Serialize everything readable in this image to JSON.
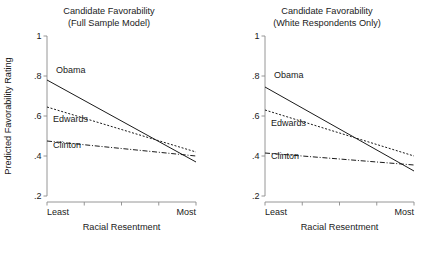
{
  "figure": {
    "width": 436,
    "height": 253,
    "background": "#ffffff",
    "ink_color": "#1a1a1a",
    "axis_color": "#8a8a8a"
  },
  "chart_data": [
    {
      "type": "line",
      "panel": "left",
      "title": "Candidate Favorability",
      "subtitle": "(Full Sample Model)",
      "xlabel": "Racial Resentment",
      "ylabel": "Predicted Favorability Rating",
      "xlim": [
        0,
        1
      ],
      "ylim": [
        0.2,
        1.0
      ],
      "grid": false,
      "legend": "inline-labels",
      "ytick_labels": [
        "1",
        ".8",
        ".6",
        ".4",
        ".2"
      ],
      "ytick_values": [
        1.0,
        0.8,
        0.6,
        0.4,
        0.2
      ],
      "xtick_labels": [
        "Least",
        "",
        "",
        "",
        "Most"
      ],
      "xtick_values": [
        0,
        0.25,
        0.5,
        0.75,
        1
      ],
      "x": [
        0,
        1
      ],
      "series": [
        {
          "name": "Obama",
          "style": "solid",
          "values": [
            0.78,
            0.37
          ],
          "label_x": 0.06,
          "label_y": 0.815
        },
        {
          "name": "Edwards",
          "style": "dotted",
          "values": [
            0.645,
            0.42
          ],
          "label_x": 0.04,
          "label_y": 0.568
        },
        {
          "name": "Clinton",
          "style": "dash-dot",
          "values": [
            0.475,
            0.4
          ],
          "label_x": 0.04,
          "label_y": 0.438
        }
      ]
    },
    {
      "type": "line",
      "panel": "right",
      "title": "Candidate Favorability",
      "subtitle": "(White Respondents Only)",
      "xlabel": "Racial Resentment",
      "ylabel": "",
      "xlim": [
        0,
        1
      ],
      "ylim": [
        0.2,
        1.0
      ],
      "grid": false,
      "legend": "inline-labels",
      "ytick_labels": [
        "1",
        ".8",
        ".6",
        ".4",
        ".2"
      ],
      "ytick_values": [
        1.0,
        0.8,
        0.6,
        0.4,
        0.2
      ],
      "xtick_labels": [
        "Least",
        "",
        "",
        "",
        "Most"
      ],
      "xtick_values": [
        0,
        0.25,
        0.5,
        0.75,
        1
      ],
      "x": [
        0,
        1
      ],
      "series": [
        {
          "name": "Obama",
          "style": "solid",
          "values": [
            0.745,
            0.325
          ],
          "label_x": 0.06,
          "label_y": 0.79
        },
        {
          "name": "Edwards",
          "style": "dotted",
          "values": [
            0.63,
            0.4
          ],
          "label_x": 0.04,
          "label_y": 0.552
        },
        {
          "name": "Clinton",
          "style": "dash-dot",
          "values": [
            0.415,
            0.355
          ],
          "label_x": 0.04,
          "label_y": 0.383
        }
      ]
    }
  ]
}
